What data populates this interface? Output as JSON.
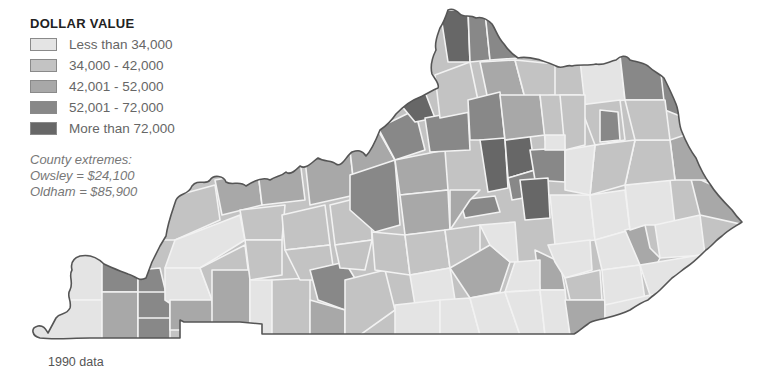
{
  "legend": {
    "title": "DOLLAR VALUE",
    "items": [
      {
        "label": "Less than 34,000",
        "color": "#e4e4e4"
      },
      {
        "label": "34,000 - 42,000",
        "color": "#c3c3c3"
      },
      {
        "label": "42,001 - 52,000",
        "color": "#a8a8a8"
      },
      {
        "label": "52,001 - 72,000",
        "color": "#888888"
      },
      {
        "label": "More than 72,000",
        "color": "#676767"
      }
    ]
  },
  "extremes": {
    "heading": "County extremes:",
    "low": "Owsley = $24,100",
    "high": "Oldham = $85,900"
  },
  "footnote": "1990 data",
  "map": {
    "region": "Kentucky",
    "unit": "county",
    "colors": {
      "c1": "#e4e4e4",
      "c2": "#c3c3c3",
      "c3": "#a8a8a8",
      "c4": "#888888",
      "c5": "#676767"
    }
  }
}
